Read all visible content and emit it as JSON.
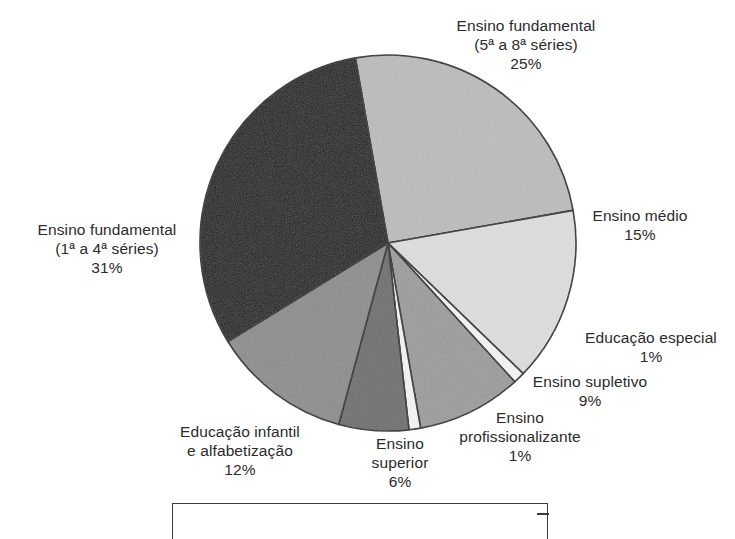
{
  "chart_data": {
    "type": "pie",
    "title": "",
    "subtitle": "",
    "xlabel": "",
    "ylabel": "",
    "legend_position": "none",
    "grid": false,
    "start_angle_deg": -100,
    "direction": "clockwise",
    "categories": [
      "Ensino fundamental (5ª a 8ª séries)",
      "Ensino médio",
      "Educação especial",
      "Ensino supletivo",
      "Ensino profissionalizante",
      "Ensino superior",
      "Educação infantil e alfabetização",
      "Ensino fundamental (1ª a 4ª séries)"
    ],
    "values": [
      25,
      15,
      1,
      9,
      1,
      6,
      12,
      31
    ],
    "value_suffix": "%",
    "slices": [
      {
        "name": "ensino-fundamental-5-8",
        "label_lines": [
          "Ensino fundamental",
          "(5ª a 8ª séries)"
        ],
        "value_text": "25%",
        "value": 25,
        "color": "#bcbcbc"
      },
      {
        "name": "ensino-medio",
        "label_lines": [
          "Ensino médio"
        ],
        "value_text": "15%",
        "value": 15,
        "color": "#dedede"
      },
      {
        "name": "educacao-especial",
        "label_lines": [
          "Educação especial"
        ],
        "value_text": "1%",
        "value": 1,
        "color": "#f4f4f4"
      },
      {
        "name": "ensino-supletivo",
        "label_lines": [
          "Ensino supletivo"
        ],
        "value_text": "9%",
        "value": 9,
        "color": "#9c9c9c"
      },
      {
        "name": "ensino-profissionalizante",
        "label_lines": [
          "Ensino",
          "profissionalizante"
        ],
        "value_text": "1%",
        "value": 1,
        "color": "#f4f4f4"
      },
      {
        "name": "ensino-superior",
        "label_lines": [
          "Ensino",
          "superior"
        ],
        "value_text": "6%",
        "value": 6,
        "color": "#6e6e6e"
      },
      {
        "name": "educacao-infantil",
        "label_lines": [
          "Educação infantil",
          "e alfabetização"
        ],
        "value_text": "12%",
        "value": 12,
        "color": "#8d8d8d"
      },
      {
        "name": "ensino-fundamental-1-4",
        "label_lines": [
          "Ensino fundamental",
          "(1ª a 4ª séries)"
        ],
        "value_text": "31%",
        "value": 31,
        "color": "#1b1b1b"
      }
    ],
    "colors": {
      "outline": "#2b2b2b",
      "text": "#2b2b2b",
      "background": "#ffffff"
    }
  },
  "labels": {
    "fund58": {
      "line1": "Ensino fundamental",
      "line2": "(5ª a 8ª séries)",
      "value": "25%"
    },
    "medio": {
      "line1": "Ensino médio",
      "value": "15%"
    },
    "especial": {
      "line1": "Educação especial",
      "value": "1%"
    },
    "supletivo": {
      "line1": "Ensino supletivo",
      "value": "9%"
    },
    "profissionalizante": {
      "line1": "Ensino",
      "line2": "profissionalizante",
      "value": "1%"
    },
    "superior": {
      "line1": "Ensino",
      "line2": "superior",
      "value": "6%"
    },
    "infantil": {
      "line1": "Educação infantil",
      "line2": "e alfabetização",
      "value": "12%"
    },
    "fund14": {
      "line1": "Ensino fundamental",
      "line2": "(1ª a 4ª séries)",
      "value": "31%"
    }
  }
}
